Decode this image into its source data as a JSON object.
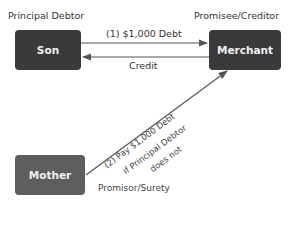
{
  "labels": {
    "principal_debtor": "Principal Debtor",
    "promisee_creditor": "Promisee/Creditor",
    "promisor_surety": "Promisor/Surety"
  },
  "nodes": {
    "son": "Son",
    "merchant": "Merchant",
    "mother": "Mother"
  },
  "edges": {
    "debt": "(1) $1,000 Debt",
    "credit": "Credit",
    "pay_line1": "(2) Pay $1,000 Debt",
    "pay_line2": "if Principal Debtor",
    "pay_line3": "does not"
  },
  "colors": {
    "box_dark": "#3a3a3a",
    "box_mother": "#5e5e5e",
    "arrow": "#555555"
  }
}
